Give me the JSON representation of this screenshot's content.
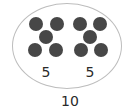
{
  "diagram": {
    "type": "number-bond-set",
    "groups": [
      {
        "label": "5",
        "count": 5,
        "dots": [
          {
            "x": 36,
            "y": 24
          },
          {
            "x": 57,
            "y": 24
          },
          {
            "x": 46,
            "y": 37
          },
          {
            "x": 35,
            "y": 50
          },
          {
            "x": 56,
            "y": 50
          }
        ],
        "label_pos": {
          "x": 46,
          "y": 65
        }
      },
      {
        "label": "5",
        "count": 5,
        "dots": [
          {
            "x": 80,
            "y": 24
          },
          {
            "x": 100,
            "y": 24
          },
          {
            "x": 90,
            "y": 37
          },
          {
            "x": 81,
            "y": 50
          },
          {
            "x": 101,
            "y": 50
          }
        ],
        "label_pos": {
          "x": 90,
          "y": 65
        }
      }
    ],
    "total": {
      "label": "10",
      "pos": {
        "x": 70,
        "y": 94
      }
    },
    "colors": {
      "dot": "#474747",
      "outline": "#bdbdbd",
      "text": "#2a2a2a"
    }
  }
}
